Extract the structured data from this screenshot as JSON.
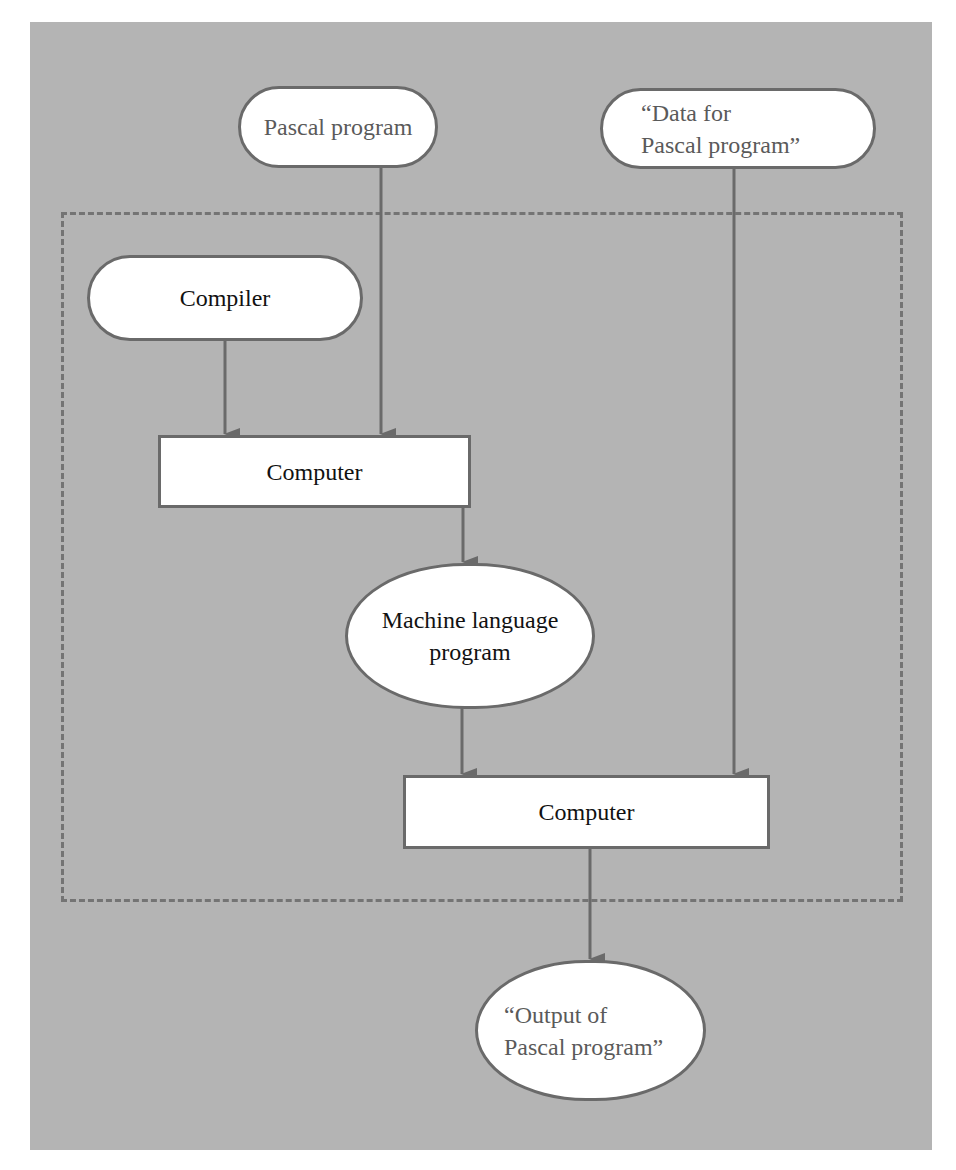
{
  "diagram": {
    "title": "",
    "nodes": {
      "pascal_program": {
        "label": "Pascal program",
        "shape": "terminal"
      },
      "data_for_program": {
        "label": "“Data for\nPascal program”",
        "shape": "terminal"
      },
      "compiler": {
        "label": "Compiler",
        "shape": "terminal"
      },
      "computer_1": {
        "label": "Computer",
        "shape": "process"
      },
      "machine_language_program": {
        "label": "Machine language\nprogram",
        "shape": "terminal"
      },
      "computer_2": {
        "label": "Computer",
        "shape": "process"
      },
      "output_of_program": {
        "label": "“Output of\nPascal program”",
        "shape": "terminal"
      }
    },
    "edges": [
      {
        "from": "pascal_program",
        "to": "computer_1"
      },
      {
        "from": "compiler",
        "to": "computer_1"
      },
      {
        "from": "computer_1",
        "to": "machine_language_program"
      },
      {
        "from": "machine_language_program",
        "to": "computer_2"
      },
      {
        "from": "data_for_program",
        "to": "computer_2"
      },
      {
        "from": "computer_2",
        "to": "output_of_program"
      }
    ],
    "group": {
      "style": "dashed",
      "contains": [
        "compiler",
        "computer_1",
        "machine_language_program",
        "computer_2"
      ]
    },
    "colors": {
      "background": "#b4b4b4",
      "node_fill": "#ffffff",
      "line": "#6a6a6a"
    }
  }
}
